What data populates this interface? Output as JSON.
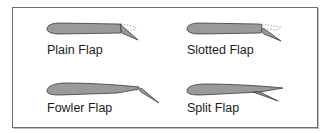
{
  "colors": {
    "airfoil_fill": "#9a9a9a",
    "airfoil_stroke": "#3a3a3a",
    "dotted_line": "#8a8a8a",
    "border": "#6e6e6e"
  },
  "flaps": [
    {
      "id": "plain",
      "label": "Plain Flap"
    },
    {
      "id": "slotted",
      "label": "Slotted Flap"
    },
    {
      "id": "fowler",
      "label": "Fowler Flap"
    },
    {
      "id": "split",
      "label": "Split Flap"
    }
  ]
}
